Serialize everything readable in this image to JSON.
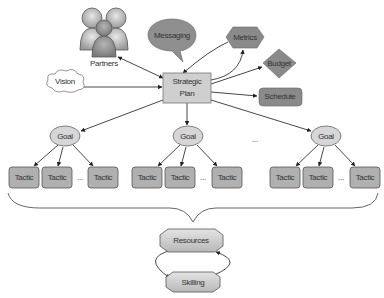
{
  "diagram": {
    "center": {
      "label_line1": "Strategic",
      "label_line2": "Plan"
    },
    "partners": {
      "label": "Partners"
    },
    "vision": {
      "label": "Vision"
    },
    "messaging": {
      "label": "Messaging"
    },
    "metrics": {
      "label": "Metrics"
    },
    "budget": {
      "label": "Budget"
    },
    "schedule": {
      "label": "Schedule"
    },
    "goals": [
      {
        "label": "Goal",
        "tactics": [
          "Tactic",
          "Tactic",
          "Tactic"
        ],
        "ellipsis": "..."
      },
      {
        "label": "Goal",
        "tactics": [
          "Tactic",
          "Tactic",
          "Tactic"
        ],
        "ellipsis": "..."
      },
      {
        "label": "Goal",
        "tactics": [
          "Tactic",
          "Tactic",
          "Tactic"
        ],
        "ellipsis": "..."
      }
    ],
    "goals_ellipsis": "...",
    "resources": {
      "label": "Resources"
    },
    "skilling": {
      "label": "Skilling"
    }
  },
  "colors": {
    "dark_fill": "#8a8a8a",
    "light_fill": "#d6d6d6",
    "center_fill": "#cfcfcf",
    "stroke": "#555555"
  }
}
